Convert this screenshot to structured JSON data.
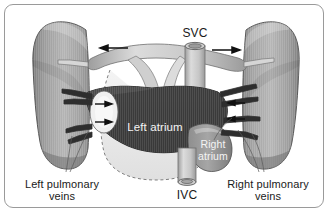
{
  "figure": {
    "type": "anatomical-diagram",
    "background_color": "#ffffff",
    "border_color": "#9a9a9a"
  },
  "labels": {
    "svc": "SVC",
    "ivc": "IVC",
    "left_atrium": "Left atrium",
    "right_atrium_line1": "Right",
    "right_atrium_line2": "atrium",
    "left_pulmonary_line1": "Left pulmonary",
    "left_pulmonary_line2": "veins",
    "right_pulmonary_line1": "Right pulmonary",
    "right_pulmonary_line2": "veins"
  },
  "structures": {
    "left_lung": "left-lung",
    "right_lung": "right-lung",
    "left_atrium_body": "left-atrium-body",
    "right_atrium_body": "right-atrium-body",
    "svc_vessel": "superior-vena-cava",
    "ivc_vessel": "inferior-vena-cava",
    "ventricle_outline": "ventricle-dashed-outline"
  },
  "arrows": {
    "top_left": "arrow-pointing-left",
    "top_right": "arrow-pointing-right",
    "left_inner_upper": "arrow-pointing-right",
    "left_inner_lower": "arrow-pointing-right",
    "right_inner_upper": "arrow-pointing-left",
    "right_inner_lower": "arrow-pointing-left"
  },
  "colors": {
    "lung_fill_light": "#b9b9b9",
    "lung_fill_dark": "#8d8d8d",
    "atrium_dark": "#3b3b3b",
    "vessel_light": "#d8d8d8",
    "vessel_mid": "#a8a8a8",
    "outline": "#3a3a3a",
    "label_dark": "#1a1a1a",
    "label_light": "#f4f4f4"
  }
}
